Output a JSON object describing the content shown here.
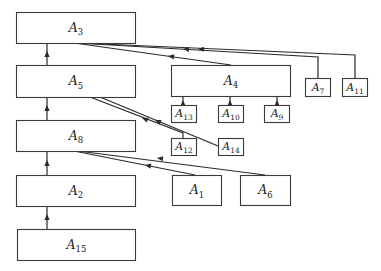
{
  "diagram": {
    "title": "",
    "colors": {
      "stroke": "#2a2a2a",
      "background": "#ffffff"
    },
    "nodes": [
      {
        "id": "A3",
        "letter": "A",
        "sub": "3",
        "x": 16,
        "y": 12,
        "w": 119,
        "h": 31
      },
      {
        "id": "A5",
        "letter": "A",
        "sub": "5",
        "x": 16,
        "y": 65,
        "w": 119,
        "h": 32
      },
      {
        "id": "A8",
        "letter": "A",
        "sub": "8",
        "x": 16,
        "y": 120,
        "w": 119,
        "h": 31
      },
      {
        "id": "A2",
        "letter": "A",
        "sub": "2",
        "x": 16,
        "y": 175,
        "w": 119,
        "h": 31
      },
      {
        "id": "A15",
        "letter": "A",
        "sub": "15",
        "x": 17,
        "y": 229,
        "w": 118,
        "h": 31
      },
      {
        "id": "A4",
        "letter": "A",
        "sub": "4",
        "x": 171,
        "y": 65,
        "w": 119,
        "h": 31
      },
      {
        "id": "A7",
        "letter": "A",
        "sub": "7",
        "x": 305,
        "y": 78,
        "w": 25,
        "h": 18
      },
      {
        "id": "A11",
        "letter": "A",
        "sub": "11",
        "x": 342,
        "y": 78,
        "w": 25,
        "h": 18
      },
      {
        "id": "A13",
        "letter": "A",
        "sub": "13",
        "x": 171,
        "y": 105,
        "w": 25,
        "h": 17
      },
      {
        "id": "A10",
        "letter": "A",
        "sub": "10",
        "x": 218,
        "y": 105,
        "w": 25,
        "h": 17
      },
      {
        "id": "A9",
        "letter": "A",
        "sub": "9",
        "x": 264,
        "y": 105,
        "w": 25,
        "h": 17
      },
      {
        "id": "A12",
        "letter": "A",
        "sub": "12",
        "x": 171,
        "y": 138,
        "w": 25,
        "h": 17
      },
      {
        "id": "A14",
        "letter": "A",
        "sub": "14",
        "x": 218,
        "y": 138,
        "w": 25,
        "h": 17
      },
      {
        "id": "A1",
        "letter": "A",
        "sub": "1",
        "x": 172,
        "y": 175,
        "w": 49,
        "h": 30
      },
      {
        "id": "A6",
        "letter": "A",
        "sub": "6",
        "x": 240,
        "y": 175,
        "w": 50,
        "h": 30
      }
    ],
    "edges": [
      {
        "from": "A5",
        "to": "A3",
        "points": [
          [
            47,
            65
          ],
          [
            47,
            43
          ]
        ],
        "arrow": [
          47,
          51
        ]
      },
      {
        "from": "A8",
        "to": "A5",
        "points": [
          [
            47,
            120
          ],
          [
            47,
            97
          ]
        ],
        "arrow": [
          47,
          105
        ]
      },
      {
        "from": "A2",
        "to": "A8",
        "points": [
          [
            47,
            175
          ],
          [
            47,
            151
          ]
        ],
        "arrow": [
          47,
          160
        ]
      },
      {
        "from": "A15",
        "to": "A2",
        "points": [
          [
            47,
            229
          ],
          [
            47,
            206
          ]
        ],
        "arrow": [
          47,
          214
        ]
      },
      {
        "from": "A4",
        "to": "A3",
        "points": [
          [
            231,
            65
          ],
          [
            74,
            43
          ]
        ],
        "arrow": [
          168,
          56
        ]
      },
      {
        "from": "A7",
        "to": "A3",
        "points": [
          [
            318,
            78
          ],
          [
            318,
            57
          ],
          [
            76,
            43
          ]
        ],
        "arrow": [
          183,
          49
        ]
      },
      {
        "from": "A11",
        "to": "A3",
        "points": [
          [
            355,
            78
          ],
          [
            355,
            64
          ],
          [
            355,
            55
          ],
          [
            78,
            43
          ]
        ],
        "arrow": [
          198,
          49
        ]
      },
      {
        "from": "A13",
        "to": "A4",
        "points": [
          [
            183,
            105
          ],
          [
            183,
            96
          ]
        ],
        "arrow": [
          183,
          100
        ]
      },
      {
        "from": "A10",
        "to": "A4",
        "points": [
          [
            230,
            105
          ],
          [
            230,
            96
          ]
        ],
        "arrow": [
          230,
          100
        ]
      },
      {
        "from": "A9",
        "to": "A4",
        "points": [
          [
            277,
            105
          ],
          [
            277,
            96
          ]
        ],
        "arrow": [
          277,
          100
        ]
      },
      {
        "from": "A12",
        "to": "A5",
        "points": [
          [
            183,
            138
          ],
          [
            183,
            133
          ],
          [
            90,
            97
          ]
        ],
        "arrow": [
          142,
          118
        ]
      },
      {
        "from": "A14",
        "to": "A5",
        "points": [
          [
            218,
            146
          ],
          [
            100,
            97
          ]
        ],
        "arrow": [
          155,
          120
        ]
      },
      {
        "from": "A1",
        "to": "A8",
        "points": [
          [
            195,
            175
          ],
          [
            74,
            151
          ]
        ],
        "arrow": [
          145,
          165
        ]
      },
      {
        "from": "A6",
        "to": "A8",
        "points": [
          [
            265,
            175
          ],
          [
            78,
            151
          ]
        ],
        "arrow": [
          157,
          158
        ]
      }
    ]
  }
}
